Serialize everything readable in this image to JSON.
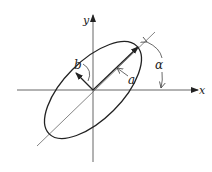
{
  "diagram": {
    "labels": {
      "x_axis": "x",
      "y_axis": "y",
      "semi_major": "a",
      "semi_minor": "b",
      "angle": "α"
    },
    "ellipse": {
      "rotation_deg": 45
    },
    "colors": {
      "ink": "#222222",
      "thin_line": "#666666",
      "background": "#ffffff"
    }
  }
}
